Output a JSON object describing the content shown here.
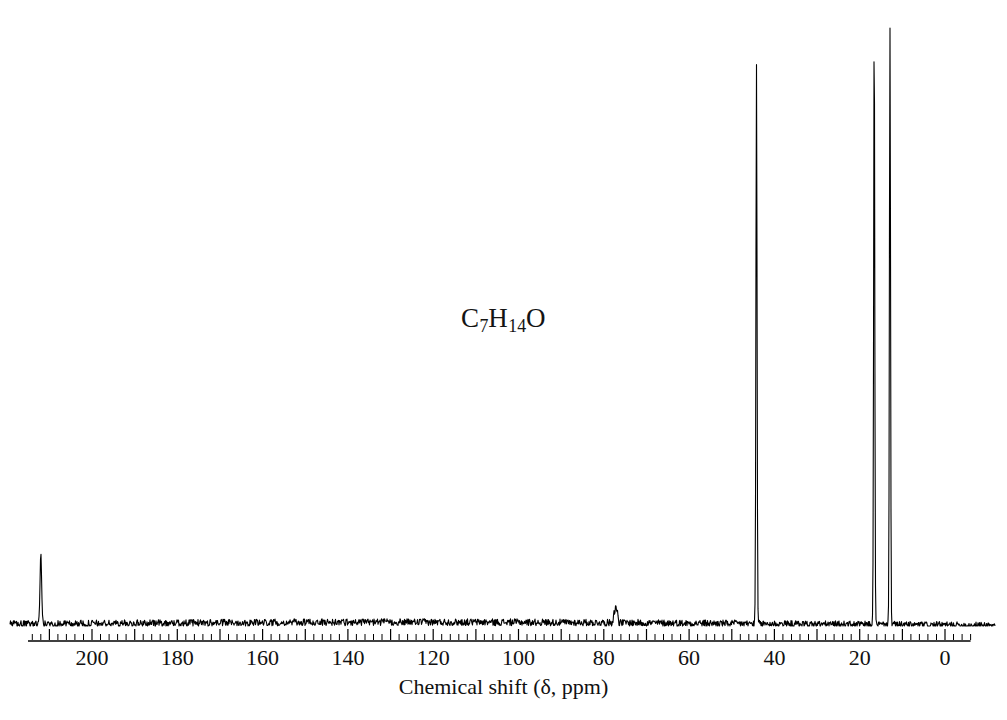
{
  "figure": {
    "formula": "C7H14O",
    "formula_parts": [
      {
        "text": "C",
        "sub": false
      },
      {
        "text": "7",
        "sub": true
      },
      {
        "text": "H",
        "sub": false
      },
      {
        "text": "14",
        "sub": true
      },
      {
        "text": "O",
        "sub": false
      }
    ],
    "background_color": "#ffffff",
    "trace_color": "#000000"
  },
  "chart_data": {
    "type": "line",
    "title": "",
    "subtitle": "",
    "xlabel": "Chemical shift (δ, ppm)",
    "ylabel": "",
    "annotations": [
      "C7H14O"
    ],
    "legend": [],
    "grid": false,
    "xlim": [
      215,
      -6
    ],
    "x_axis_reversed": true,
    "ylim": [
      0,
      100
    ],
    "xticks": [
      200,
      180,
      160,
      140,
      120,
      100,
      80,
      60,
      40,
      20,
      0
    ],
    "xtick_labels": [
      "200",
      "180",
      "160",
      "140",
      "120",
      "100",
      "80",
      "60",
      "40",
      "20",
      "0"
    ],
    "minor_tick_interval_ppm": 2,
    "major_tick_interval_ppm": 10,
    "baseline_intensity": 0,
    "peaks": [
      {
        "ppm": 212.0,
        "intensity": 11.5,
        "width_ppm": 0.45,
        "label": "carbonyl C=O"
      },
      {
        "ppm": 77.6,
        "intensity": 2.0,
        "width_ppm": 0.35,
        "label": "CDCl3 solvent"
      },
      {
        "ppm": 77.2,
        "intensity": 2.4,
        "width_ppm": 0.35,
        "label": "CDCl3 solvent"
      },
      {
        "ppm": 76.8,
        "intensity": 2.0,
        "width_ppm": 0.35,
        "label": "CDCl3 solvent"
      },
      {
        "ppm": 44.2,
        "intensity": 93.5,
        "width_ppm": 0.3,
        "label": "CH2 / CH"
      },
      {
        "ppm": 16.6,
        "intensity": 100.0,
        "width_ppm": 0.3,
        "label": "CH3"
      },
      {
        "ppm": 12.9,
        "intensity": 100.0,
        "width_ppm": 0.3,
        "label": "CH3"
      }
    ]
  }
}
